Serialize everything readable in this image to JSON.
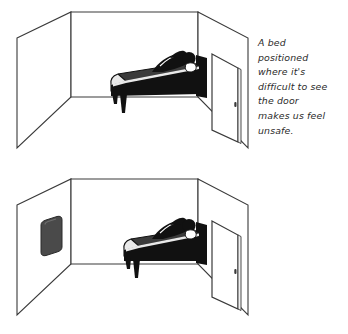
{
  "figure": {
    "background_color": "#ffffff",
    "ink_color": "#1a1a1a",
    "mirror_color": "#4a4a4a",
    "panel_count": 2
  },
  "panels": [
    {
      "id": "panel-1",
      "scene_name": "room-bed-facing-away-from-door",
      "caption": "A bed\npositioned\nwhere it's\ndifficult to see\nthe door\nmakes us feel\nunsafe.",
      "caption_lines": [
        "A bed",
        "positioned",
        "where it's",
        "difficult to see",
        "the door",
        "makes us feel",
        "unsafe."
      ],
      "elements": [
        "left-wall",
        "back-wall",
        "right-wall",
        "open-door",
        "doorknob",
        "bed",
        "headboard",
        "sleeping-person",
        "pillow"
      ],
      "has_mirror": false
    },
    {
      "id": "panel-2",
      "scene_name": "room-bed-with-mirror-reflecting-doorway",
      "caption": "Cure the\ncondition by\nhanging a\nmirror to\nreflect the\ndoorway.",
      "caption_lines": [
        "Cure the",
        "condition by",
        "hanging a",
        "mirror to",
        "reflect the",
        "doorway."
      ],
      "elements": [
        "left-wall",
        "mirror",
        "back-wall",
        "right-wall",
        "open-door",
        "doorknob",
        "bed",
        "headboard",
        "sleeping-person",
        "pillow"
      ],
      "has_mirror": true
    }
  ]
}
